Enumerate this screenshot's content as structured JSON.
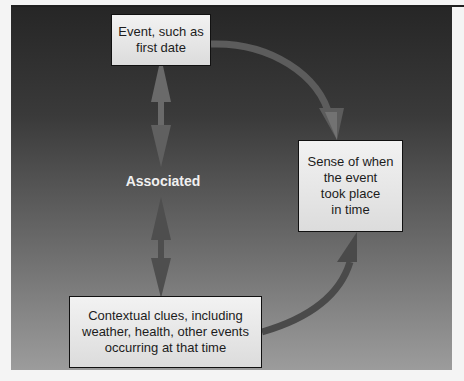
{
  "diagram": {
    "nodes": {
      "event": "Event, such as\nfirst date",
      "sense": "Sense of when\nthe event\ntook place\nin time",
      "context": "Contextual clues, including\nweather, health, other events\noccurring at that time"
    },
    "association_label": "Associated",
    "edges": [
      {
        "from": "event",
        "to": "sense",
        "type": "curved-arrow"
      },
      {
        "from": "context",
        "to": "sense",
        "type": "curved-arrow"
      },
      {
        "from": "event",
        "to": "context",
        "type": "bidirectional",
        "label": "Associated"
      }
    ],
    "colors": {
      "background_top": "#262626",
      "background_bottom": "#9c9c9c",
      "box_fill": "#ececec",
      "arrow_top": "#6a6a6a",
      "arrow_bottom": "#4a4a4a"
    }
  }
}
